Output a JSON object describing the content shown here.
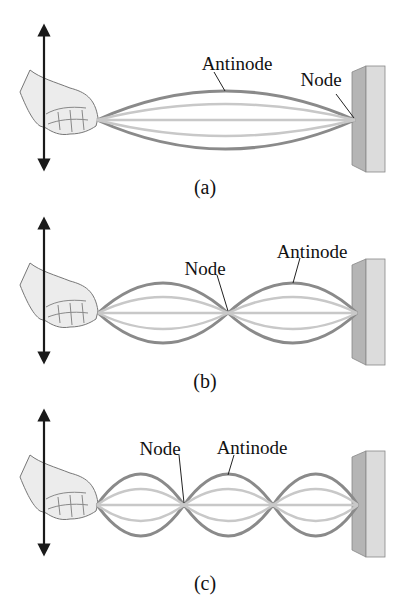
{
  "panels": [
    {
      "id": "a",
      "caption": "(a)",
      "labels": {
        "antinode": "Antinode",
        "node": "Node"
      },
      "loops": 1
    },
    {
      "id": "b",
      "caption": "(b)",
      "labels": {
        "node": "Node",
        "antinode": "Antinode"
      },
      "loops": 2
    },
    {
      "id": "c",
      "caption": "(c)",
      "labels": {
        "node": "Node",
        "antinode": "Antinode"
      },
      "loops": 3
    }
  ],
  "colors": {
    "string_outer": "#8a8a8a",
    "string_inner": "#c8c8c8",
    "wall_front": "#d9d9d9",
    "wall_side": "#b5b5b5",
    "arrow": "#1a1a1a",
    "hand_fill": "#ececec",
    "hand_stroke": "#777777"
  }
}
